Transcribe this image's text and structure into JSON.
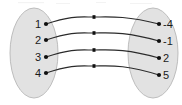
{
  "diagram": {
    "type": "mapping-diagram",
    "canvas": {
      "width": 182,
      "height": 105
    },
    "colors": {
      "set_fill": "#e2e2e2",
      "set_stroke": "#bdbdbd",
      "curve": "#2b2b2b",
      "dot": "#101010",
      "label": "#1a1a1a",
      "background": "#ffffff"
    },
    "domain_set": {
      "name": "domain-set",
      "shape": "ellipse",
      "cx": 34,
      "cy": 53,
      "rx": 24,
      "ry": 45,
      "elements": [
        {
          "label": "1",
          "x": 45,
          "y": 24
        },
        {
          "label": "2",
          "x": 45,
          "y": 40
        },
        {
          "label": "3",
          "x": 45,
          "y": 57
        },
        {
          "label": "4",
          "x": 45,
          "y": 73
        }
      ]
    },
    "range_set": {
      "name": "range-set",
      "shape": "ellipse",
      "cx": 153,
      "cy": 53,
      "rx": 25,
      "ry": 45,
      "elements": [
        {
          "label": "-4",
          "x": 160,
          "y": 24
        },
        {
          "label": "-1",
          "x": 160,
          "y": 41
        },
        {
          "label": "2",
          "x": 160,
          "y": 58
        },
        {
          "label": "5",
          "x": 160,
          "y": 75
        }
      ]
    },
    "mappings": [
      {
        "from": "1",
        "to": "-4",
        "x1": 46,
        "y1": 24,
        "x2": 159,
        "y2": 24,
        "mx": 94,
        "my": 17
      },
      {
        "from": "2",
        "to": "-1",
        "x1": 46,
        "y1": 40,
        "x2": 159,
        "y2": 41,
        "mx": 94,
        "my": 33
      },
      {
        "from": "3",
        "to": "2",
        "x1": 46,
        "y1": 57,
        "x2": 159,
        "y2": 58,
        "mx": 94,
        "my": 50
      },
      {
        "from": "4",
        "to": "5",
        "x1": 46,
        "y1": 73,
        "x2": 159,
        "y2": 75,
        "mx": 94,
        "my": 66
      }
    ]
  }
}
